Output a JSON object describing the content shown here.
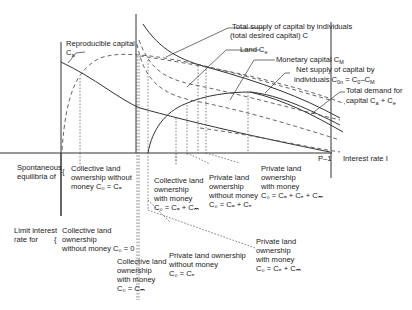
{
  "diagram": {
    "x_axis": {
      "label": "Interest rate I",
      "marker": "P–1"
    },
    "curves": {
      "reproducible_capital": {
        "label": "Reproducible capital",
        "symbol": "C",
        "sub": "a"
      },
      "total_supply": {
        "line1": "Total supply of capital by individuals",
        "line2": "(total desired capital) C",
        "sub": "0"
      },
      "land": {
        "label": "Land C",
        "sub": "e"
      },
      "monetary_capital": {
        "label": "Monetary capital C",
        "sub": "M"
      },
      "net_supply": {
        "line1": "Net supply of capital by",
        "line2": "individuals C",
        "sub1": "0n",
        "mid": " = C",
        "sub2": "0",
        "end": "–C",
        "sub3": "M"
      },
      "total_demand": {
        "line1": "Total demand for",
        "line2": "capital  C",
        "sub1": "a",
        "mid": " + C",
        "sub2": "e"
      }
    },
    "left_labels": {
      "spontaneous": {
        "line1": "Spontaneous",
        "line2": "equilibria of"
      },
      "limit": {
        "line1": "Limit interest",
        "line2": "rate for"
      }
    },
    "cases": [
      {
        "id": "coll-no-money",
        "lines": [
          "Collective land",
          "ownership without",
          "money C₀ = Cₐ"
        ]
      },
      {
        "id": "coll-with-money",
        "lines": [
          "Collective land",
          "ownership",
          "with money",
          "C₀ = Cₐ + Cₘ"
        ]
      },
      {
        "id": "priv-no-money",
        "lines": [
          "Private land",
          "ownership",
          "without money",
          "C₀ = Cₐ + Cₑ"
        ]
      },
      {
        "id": "priv-with-money",
        "lines": [
          "Private land",
          "ownership",
          "with money",
          "C₀ = Cₐ + Cₑ + Cₘ"
        ]
      },
      {
        "id": "limit-coll-no-money",
        "lines": [
          "Collective land",
          "ownership",
          "without money C₀ = 0"
        ]
      },
      {
        "id": "limit-coll-with-money",
        "lines": [
          "Collective land",
          "ownership",
          "with money",
          "C₀ = Cₘ"
        ]
      },
      {
        "id": "limit-priv-no-money",
        "lines": [
          "Private land ownership",
          "without money",
          "C₀ = Cₑ"
        ]
      },
      {
        "id": "limit-priv-with-money",
        "lines": [
          "Private land",
          "ownership",
          "with money",
          "C₀ = Cₑ + Cₘ"
        ]
      }
    ]
  }
}
